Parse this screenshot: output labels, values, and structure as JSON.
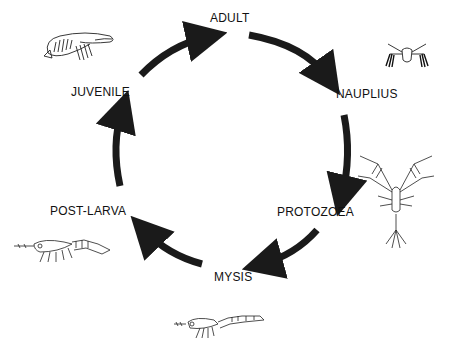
{
  "diagram": {
    "title": "",
    "type": "life-cycle",
    "stages": [
      {
        "id": "adult",
        "label": "ADULT"
      },
      {
        "id": "nauplius",
        "label": "NAUPLIUS"
      },
      {
        "id": "protozoea",
        "label": "PROTOZOEA"
      },
      {
        "id": "mysis",
        "label": "MYSIS"
      },
      {
        "id": "post-larva",
        "label": "POST-LARVA"
      },
      {
        "id": "juvenile",
        "label": "JUVENILE"
      }
    ],
    "arrow_color": "#1a1a1a",
    "line_color": "#222222"
  }
}
